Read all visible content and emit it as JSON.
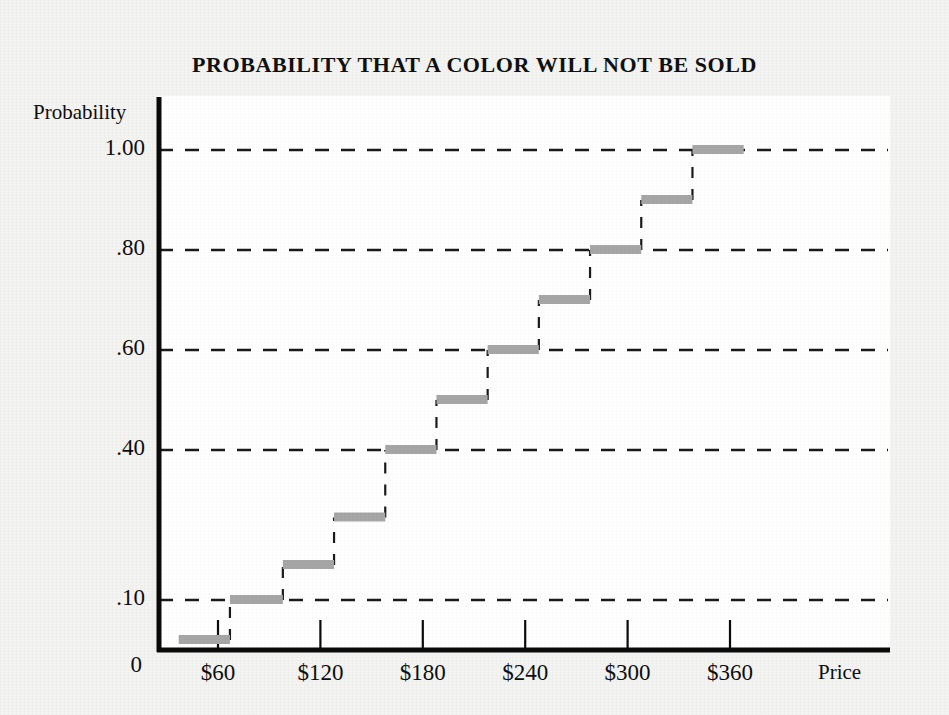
{
  "chart_data": {
    "type": "line",
    "title": "PROBABILITY THAT A COLOR WILL NOT BE SOLD",
    "xlabel": "Price",
    "ylabel": "Probability",
    "grid": true,
    "legend": false,
    "xlim": [
      0,
      430
    ],
    "ylim": [
      0,
      1.08
    ],
    "x_tick_labels": [
      "$60",
      "$120",
      "$180",
      "$240",
      "$300",
      "$360"
    ],
    "x_tick_values": [
      60,
      120,
      180,
      240,
      300,
      360
    ],
    "y_tick_labels": [
      "0",
      ".10",
      ".40",
      ".60",
      ".80",
      "1.00"
    ],
    "y_tick_values": [
      0,
      0.1,
      0.4,
      0.6,
      0.8,
      1.0
    ],
    "gridline_values": [
      0.1,
      0.4,
      0.6,
      0.8,
      1.0
    ],
    "origin_label": "0",
    "series": [
      {
        "name": "Cumulative probability not sold",
        "style": "step",
        "steps": [
          {
            "x_start": 37,
            "x_end": 67,
            "y": 0.02
          },
          {
            "x_start": 67,
            "x_end": 98,
            "y": 0.1
          },
          {
            "x_start": 98,
            "x_end": 128,
            "y": 0.17
          },
          {
            "x_start": 128,
            "x_end": 158,
            "y": 0.265
          },
          {
            "x_start": 158,
            "x_end": 188,
            "y": 0.4
          },
          {
            "x_start": 188,
            "x_end": 218,
            "y": 0.5
          },
          {
            "x_start": 218,
            "x_end": 248,
            "y": 0.6
          },
          {
            "x_start": 248,
            "x_end": 278,
            "y": 0.7
          },
          {
            "x_start": 278,
            "x_end": 308,
            "y": 0.8
          },
          {
            "x_start": 308,
            "x_end": 338,
            "y": 0.9
          },
          {
            "x_start": 338,
            "x_end": 368,
            "y": 1.0
          }
        ]
      }
    ],
    "colors": {
      "tread": "#a6a6a6",
      "riser": "#1a1a1a",
      "axis": "#0a0a0a",
      "grid": "#1a1a1a",
      "plot_background": "#ffffff",
      "figure_background": "#f3f3f1"
    }
  }
}
